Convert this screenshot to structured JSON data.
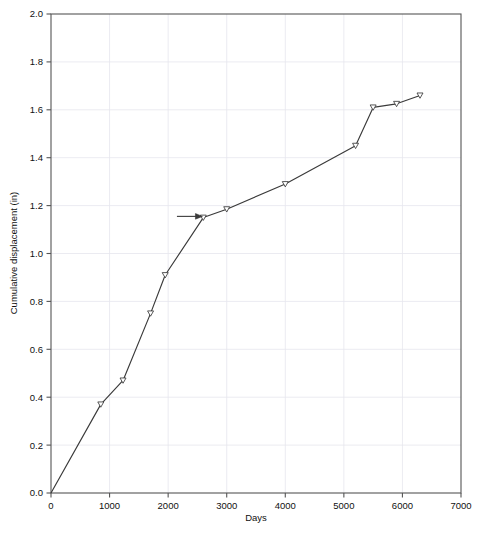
{
  "figure": {
    "background_color": "#ffffff",
    "line_color": "#3a3a3a",
    "grid_color": "#e6e6ee",
    "axis_color": "#555555",
    "caption": ""
  },
  "chart_data": {
    "type": "line",
    "title": "",
    "xlabel": "Days",
    "ylabel": "Cumulative displacement (in)",
    "xlim": [
      0,
      7000
    ],
    "ylim": [
      0.0,
      2.0
    ],
    "xticks": [
      0,
      1000,
      2000,
      3000,
      4000,
      5000,
      6000,
      7000
    ],
    "xtick_labels": [
      "0",
      "1000",
      "2000",
      "3000",
      "4000",
      "5000",
      "6000",
      "7000"
    ],
    "yticks": [
      0.0,
      0.2,
      0.4,
      0.6,
      0.8,
      1.0,
      1.2,
      1.4,
      1.6,
      1.8,
      2.0
    ],
    "ytick_labels": [
      "0.0",
      "0.2",
      "0.4",
      "0.6",
      "0.8",
      "1.0",
      "1.2",
      "1.4",
      "1.6",
      "1.8",
      "2.0"
    ],
    "grid": true,
    "legend": "none",
    "marker": "open-triangle-down",
    "series": [
      {
        "name": "Cumulative displacement",
        "x": [
          0,
          850,
          1230,
          1700,
          1950,
          2600,
          3000,
          4000,
          5200,
          5500,
          5900,
          6300
        ],
        "y": [
          0.0,
          0.37,
          0.47,
          0.75,
          0.91,
          1.15,
          1.185,
          1.29,
          1.45,
          1.61,
          1.625,
          1.66
        ]
      }
    ],
    "annotations": [
      {
        "type": "arrow",
        "label": "",
        "x_start": 2150,
        "x_end": 2560,
        "y": 1.155,
        "direction": "right"
      }
    ]
  }
}
